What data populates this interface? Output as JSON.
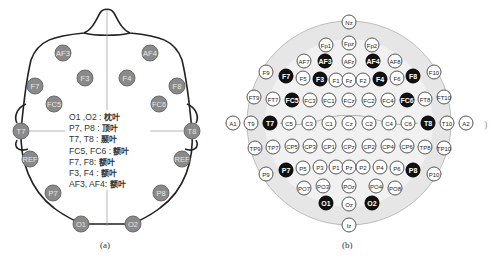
{
  "figure_a": {
    "caption": "(a)",
    "electrodes": [
      {
        "label": "AF3",
        "x": 63,
        "y": 53
      },
      {
        "label": "AF4",
        "x": 150,
        "y": 53
      },
      {
        "label": "F3",
        "x": 85,
        "y": 78
      },
      {
        "label": "F4",
        "x": 127,
        "y": 78
      },
      {
        "label": "F7",
        "x": 35,
        "y": 86
      },
      {
        "label": "F8",
        "x": 177,
        "y": 86
      },
      {
        "label": "FC5",
        "x": 54,
        "y": 104
      },
      {
        "label": "FC6",
        "x": 159,
        "y": 104
      },
      {
        "label": "T7",
        "x": 21,
        "y": 131
      },
      {
        "label": "T8",
        "x": 192,
        "y": 131
      },
      {
        "label": "REF",
        "x": 30,
        "y": 159
      },
      {
        "label": "REF",
        "x": 182,
        "y": 159
      },
      {
        "label": "P7",
        "x": 53,
        "y": 193
      },
      {
        "label": "P8",
        "x": 161,
        "y": 193
      },
      {
        "label": "O1",
        "x": 81,
        "y": 224
      },
      {
        "label": "O2",
        "x": 133,
        "y": 224
      }
    ],
    "legend": [
      {
        "channels": "O1 ,O2 :",
        "lobe": "枕叶"
      },
      {
        "channels": "P7, P8 :",
        "lobe": "顶叶"
      },
      {
        "channels": "T7, T8 :",
        "lobe": "颞叶"
      },
      {
        "channels": "FC5, FC6 :",
        "lobe": "额叶"
      },
      {
        "channels": "F7, F8:",
        "lobe": "额叶"
      },
      {
        "channels": "F3, F4 :",
        "lobe": "额叶"
      },
      {
        "channels": "AF3, AF4:",
        "lobe": "额叶"
      }
    ]
  },
  "figure_b": {
    "caption": "(b)",
    "highlighted": [
      "AF3",
      "AF4",
      "F7",
      "F3",
      "F4",
      "F8",
      "FC5",
      "FC6",
      "T7",
      "T8",
      "P7",
      "P8",
      "O1",
      "O2"
    ],
    "electrodes": [
      {
        "label": "Nz",
        "x": 349,
        "y": 22
      },
      {
        "label": "Fp1",
        "x": 326,
        "y": 45
      },
      {
        "label": "Fpz",
        "x": 349,
        "y": 43
      },
      {
        "label": "Fp2",
        "x": 372,
        "y": 45
      },
      {
        "label": "AF7",
        "x": 304,
        "y": 61
      },
      {
        "label": "AF3",
        "x": 325,
        "y": 61
      },
      {
        "label": "AFz",
        "x": 349,
        "y": 61
      },
      {
        "label": "AF4",
        "x": 373,
        "y": 61
      },
      {
        "label": "AF8",
        "x": 395,
        "y": 61
      },
      {
        "label": "F9",
        "x": 266,
        "y": 72
      },
      {
        "label": "F7",
        "x": 286,
        "y": 76
      },
      {
        "label": "F5",
        "x": 303,
        "y": 78
      },
      {
        "label": "F3",
        "x": 320,
        "y": 79
      },
      {
        "label": "F1",
        "x": 336,
        "y": 80
      },
      {
        "label": "Fz",
        "x": 349,
        "y": 80
      },
      {
        "label": "F2",
        "x": 363,
        "y": 80
      },
      {
        "label": "F4",
        "x": 380,
        "y": 79
      },
      {
        "label": "F6",
        "x": 397,
        "y": 78
      },
      {
        "label": "F8",
        "x": 413,
        "y": 76
      },
      {
        "label": "F10",
        "x": 434,
        "y": 72
      },
      {
        "label": "FT9",
        "x": 254,
        "y": 97
      },
      {
        "label": "FT7",
        "x": 273,
        "y": 99
      },
      {
        "label": "FC5",
        "x": 292,
        "y": 100
      },
      {
        "label": "FC3",
        "x": 310,
        "y": 100
      },
      {
        "label": "FC1",
        "x": 329,
        "y": 100
      },
      {
        "label": "FCz",
        "x": 349,
        "y": 100
      },
      {
        "label": "FC2",
        "x": 369,
        "y": 100
      },
      {
        "label": "FC4",
        "x": 388,
        "y": 100
      },
      {
        "label": "FC6",
        "x": 407,
        "y": 100
      },
      {
        "label": "FT8",
        "x": 425,
        "y": 99
      },
      {
        "label": "FT10",
        "x": 444,
        "y": 97
      },
      {
        "label": "A1",
        "x": 233,
        "y": 123
      },
      {
        "label": "T9",
        "x": 251,
        "y": 123
      },
      {
        "label": "T7",
        "x": 270,
        "y": 123
      },
      {
        "label": "C5",
        "x": 289,
        "y": 123
      },
      {
        "label": "C3",
        "x": 309,
        "y": 123
      },
      {
        "label": "C1",
        "x": 329,
        "y": 123
      },
      {
        "label": "Cz",
        "x": 349,
        "y": 123
      },
      {
        "label": "C2",
        "x": 369,
        "y": 123
      },
      {
        "label": "C4",
        "x": 389,
        "y": 123
      },
      {
        "label": "C6",
        "x": 408,
        "y": 123
      },
      {
        "label": "T8",
        "x": 428,
        "y": 123
      },
      {
        "label": "T10",
        "x": 447,
        "y": 123
      },
      {
        "label": "A2",
        "x": 466,
        "y": 123
      },
      {
        "label": "TP9",
        "x": 255,
        "y": 148
      },
      {
        "label": "TP7",
        "x": 273,
        "y": 147
      },
      {
        "label": "CP5",
        "x": 292,
        "y": 146
      },
      {
        "label": "CP3",
        "x": 310,
        "y": 146
      },
      {
        "label": "CP1",
        "x": 329,
        "y": 146
      },
      {
        "label": "CPz",
        "x": 349,
        "y": 146
      },
      {
        "label": "CP2",
        "x": 369,
        "y": 146
      },
      {
        "label": "CP4",
        "x": 388,
        "y": 146
      },
      {
        "label": "CP6",
        "x": 407,
        "y": 146
      },
      {
        "label": "TP8",
        "x": 425,
        "y": 147
      },
      {
        "label": "TP10",
        "x": 444,
        "y": 148
      },
      {
        "label": "P9",
        "x": 266,
        "y": 174
      },
      {
        "label": "P7",
        "x": 286,
        "y": 170
      },
      {
        "label": "P5",
        "x": 303,
        "y": 168
      },
      {
        "label": "P3",
        "x": 320,
        "y": 167
      },
      {
        "label": "P1",
        "x": 336,
        "y": 167
      },
      {
        "label": "Pz",
        "x": 349,
        "y": 167
      },
      {
        "label": "P2",
        "x": 363,
        "y": 167
      },
      {
        "label": "P4",
        "x": 380,
        "y": 167
      },
      {
        "label": "P6",
        "x": 397,
        "y": 168
      },
      {
        "label": "P8",
        "x": 413,
        "y": 170
      },
      {
        "label": "P10",
        "x": 434,
        "y": 174
      },
      {
        "label": "PO7",
        "x": 304,
        "y": 188
      },
      {
        "label": "PO3",
        "x": 323,
        "y": 186
      },
      {
        "label": "POz",
        "x": 349,
        "y": 186
      },
      {
        "label": "PO4",
        "x": 376,
        "y": 186
      },
      {
        "label": "PO8",
        "x": 395,
        "y": 188
      },
      {
        "label": "O1",
        "x": 326,
        "y": 203
      },
      {
        "label": "Oz",
        "x": 349,
        "y": 204
      },
      {
        "label": "O2",
        "x": 372,
        "y": 203
      },
      {
        "label": "Iz",
        "x": 349,
        "y": 225
      }
    ]
  }
}
